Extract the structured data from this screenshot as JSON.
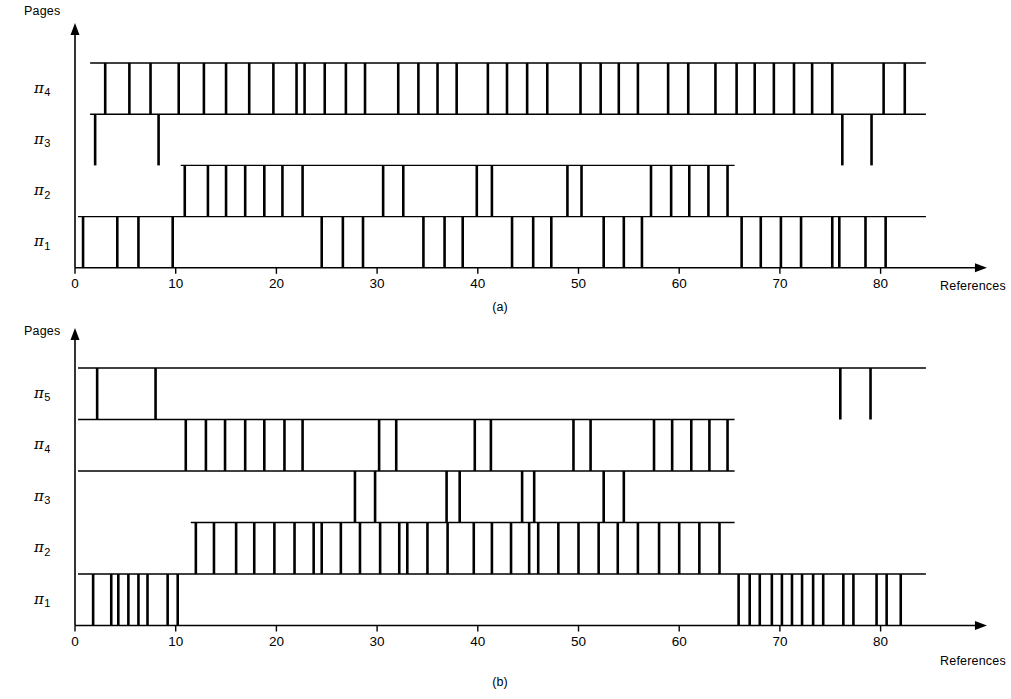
{
  "figure": {
    "axis": {
      "y_title": "Pages",
      "x_title": "References",
      "x_ticks": [
        0,
        10,
        20,
        30,
        40,
        50,
        60,
        70,
        80
      ],
      "x_min": 0,
      "x_max": 85
    },
    "panels": [
      {
        "id": "a",
        "caption": "(a)",
        "row_labels": [
          "π",
          "π",
          "π",
          "π"
        ],
        "rows": [
          {
            "label_pi": "π",
            "label_sub": "4"
          },
          {
            "label_pi": "π",
            "label_sub": "3"
          },
          {
            "label_pi": "π",
            "label_sub": "2"
          },
          {
            "label_pi": "π",
            "label_sub": "1"
          }
        ]
      },
      {
        "id": "b",
        "caption": "(b)",
        "rows": [
          {
            "label_pi": "π",
            "label_sub": "5"
          },
          {
            "label_pi": "π",
            "label_sub": "4"
          },
          {
            "label_pi": "π",
            "label_sub": "3"
          },
          {
            "label_pi": "π",
            "label_sub": "2"
          },
          {
            "label_pi": "π",
            "label_sub": "1"
          }
        ]
      }
    ]
  },
  "chart_data": [
    {
      "type": "table",
      "title": "(a)",
      "xlabel": "References",
      "ylabel": "Pages",
      "xlim": [
        0,
        85
      ],
      "grid": false,
      "legend": "none",
      "categories": [
        "π4",
        "π3",
        "π2",
        "π1"
      ],
      "series": [
        {
          "name": "π4",
          "row_start": 1.5,
          "row_end": 84.5,
          "values": [
            3,
            5.4,
            7.5,
            10.3,
            12.8,
            15,
            17.3,
            19.7,
            22,
            22.8,
            24.8,
            26.9,
            28.8,
            32.1,
            34.1,
            36,
            37.9,
            41,
            42.9,
            44.9,
            46.9,
            50.2,
            52.2,
            54,
            55.9,
            58.9,
            60.9,
            63.6,
            65.7,
            67.5,
            69.4,
            71.4,
            73.2,
            75.2,
            80.3,
            82.4
          ]
        },
        {
          "name": "π3",
          "row_start": 1.5,
          "row_end": 84.5,
          "values": [
            2,
            8.3,
            76.2,
            79.1
          ]
        },
        {
          "name": "π2",
          "row_start": 10.5,
          "row_end": 65.5,
          "values": [
            10.9,
            13.2,
            15,
            16.9,
            18.8,
            20.6,
            22.6,
            30.6,
            32.6,
            39.9,
            41.4,
            48.9,
            50.3,
            57.2,
            59.2,
            61,
            62.9,
            64.8
          ]
        },
        {
          "name": "π1",
          "row_start": 0.3,
          "row_end": 84.5,
          "values": [
            0.8,
            4.2,
            6.3,
            9.7,
            24.5,
            26.6,
            28.6,
            34.6,
            36.7,
            38.5,
            43.4,
            45.5,
            47.3,
            52.5,
            54.5,
            56.3,
            66.2,
            68.1,
            70.1,
            72.1,
            75.2,
            75.9,
            78.5,
            80.5
          ]
        }
      ]
    },
    {
      "type": "table",
      "title": "(b)",
      "xlabel": "References",
      "ylabel": "Pages",
      "xlim": [
        0,
        85
      ],
      "grid": false,
      "legend": "none",
      "categories": [
        "π5",
        "π4",
        "π3",
        "π2",
        "π1"
      ],
      "series": [
        {
          "name": "π5",
          "row_start": 0.3,
          "row_end": 84.5,
          "values": [
            2.2,
            8.0,
            76.0,
            79.0
          ]
        },
        {
          "name": "π4",
          "row_start": 0.3,
          "row_end": 65.5,
          "values": [
            11.0,
            13.0,
            14.9,
            16.9,
            18.8,
            20.8,
            22.6,
            30.2,
            31.9,
            39.7,
            41.3,
            49.5,
            51.2,
            57.5,
            59.3,
            61.2,
            63.0,
            64.8
          ]
        },
        {
          "name": "π3",
          "row_start": 0.3,
          "row_end": 65.5,
          "values": [
            27.8,
            29.8,
            36.9,
            38.2,
            44.4,
            45.6,
            52.5,
            54.5
          ]
        },
        {
          "name": "π2",
          "row_start": 11.5,
          "row_end": 65.5,
          "values": [
            12.0,
            13.8,
            16.0,
            17.8,
            19.8,
            21.8,
            23.7,
            24.5,
            26.4,
            28.3,
            30.3,
            32.2,
            33.0,
            35.0,
            37.0,
            39.6,
            41.4,
            43.3,
            45.1,
            46.0,
            48.0,
            50.0,
            52.0,
            53.9,
            55.9,
            58.0,
            60.0,
            62.0,
            64.0
          ]
        },
        {
          "name": "π1",
          "row_start": 0.3,
          "row_end": 84.5,
          "values": [
            1.8,
            3.6,
            4.3,
            5.3,
            6.3,
            7.2,
            9.2,
            10.2,
            65.9,
            67.0,
            68.0,
            69.2,
            70.2,
            71.2,
            72.2,
            73.3,
            74.3,
            76.3,
            77.3,
            79.6,
            80.6,
            82.0
          ]
        }
      ]
    }
  ]
}
